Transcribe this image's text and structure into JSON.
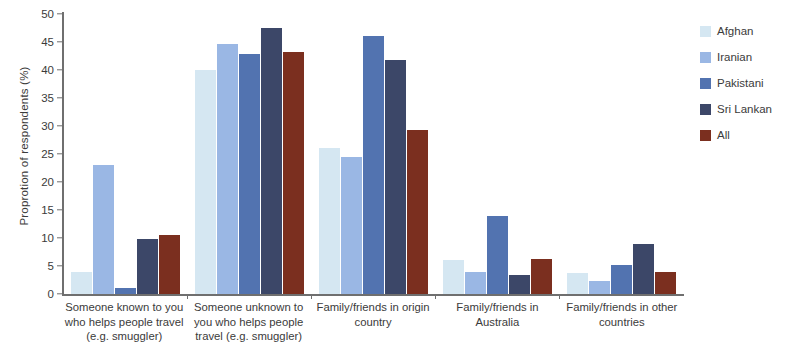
{
  "chart_data": {
    "type": "bar",
    "title": "",
    "subtitle": "",
    "xlabel": "",
    "ylabel": "Proprotion of respondents (%)",
    "ylim": [
      0,
      50
    ],
    "ytick_step": 5,
    "yticks": [
      0,
      5,
      10,
      15,
      20,
      25,
      30,
      35,
      40,
      45,
      50
    ],
    "grid": false,
    "legend_position": "right",
    "categories": [
      "Someone known to you who helps people travel (e.g. smuggler)",
      "Someone unknown to you who helps people travel (e.g. smuggler)",
      "Family/friends in origin country",
      "Family/friends in Australia",
      "Family/friends in other countries"
    ],
    "category_lines": [
      [
        "Someone known to you",
        "who helps people travel",
        "(e.g. smuggler)"
      ],
      [
        "Someone unknown to",
        "you who helps people",
        "travel (e.g. smuggler)"
      ],
      [
        "Family/friends in origin",
        "country"
      ],
      [
        "Family/friends in",
        "Australia"
      ],
      [
        "Family/friends in other",
        "countries"
      ]
    ],
    "series": [
      {
        "name": "Afghan",
        "color": "#d5e7f2",
        "values": [
          4.0,
          40.0,
          26.0,
          6.0,
          3.7
        ]
      },
      {
        "name": "Iranian",
        "color": "#9ab7e4",
        "values": [
          23.0,
          44.6,
          24.5,
          4.0,
          2.4
        ]
      },
      {
        "name": "Pakistani",
        "color": "#5273b0",
        "values": [
          1.0,
          42.9,
          46.0,
          14.0,
          5.2
        ]
      },
      {
        "name": "Sri Lankan",
        "color": "#3c4768",
        "values": [
          9.8,
          47.5,
          41.8,
          3.4,
          9.0
        ]
      },
      {
        "name": "All",
        "color": "#7b2f1f",
        "values": [
          10.6,
          43.2,
          29.2,
          6.2,
          4.0
        ]
      }
    ]
  }
}
